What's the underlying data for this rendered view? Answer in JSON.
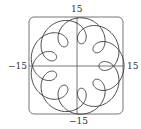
{
  "chart_data": {
    "type": "line",
    "subtype": "parametric",
    "title": "",
    "xlabel": "",
    "ylabel": "",
    "equations": {
      "x": "11 cos t - 4 cos(11t/2)",
      "y": "11 sin t - 4 sin(11t/2)",
      "t_range": [
        0,
        12.566
      ]
    },
    "params": {
      "R": 11,
      "r": 4,
      "k": 5.5,
      "t_max": 12.566,
      "samples": 900
    },
    "xlim": [
      -15,
      15
    ],
    "ylim": [
      -15,
      15
    ],
    "tick_labels": {
      "top": "15",
      "bottom": "−15",
      "left": "−15",
      "right": "15"
    },
    "loops": 9,
    "grid": false,
    "legend": null
  },
  "colors": {
    "curve": "#333333",
    "frame": "#666666",
    "axes": "#555555"
  }
}
